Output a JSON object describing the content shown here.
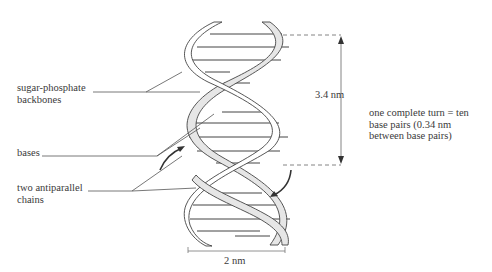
{
  "diagram": {
    "labels": {
      "sugar_phosphate_line1": "sugar-phosphate",
      "sugar_phosphate_line2": "backbones",
      "bases": "bases",
      "antiparallel_line1": "two antiparallel",
      "antiparallel_line2": "chains"
    },
    "dimensions": {
      "pitch": "3.4 nm",
      "width": "2 nm"
    },
    "note": {
      "line1": "one complete turn = ten",
      "line2": "base pairs (0.34 nm",
      "line3": "between base pairs)"
    },
    "colors": {
      "line": "#3a3a3a",
      "strand_fill": "#e6e6e6",
      "background": "#ffffff"
    }
  }
}
